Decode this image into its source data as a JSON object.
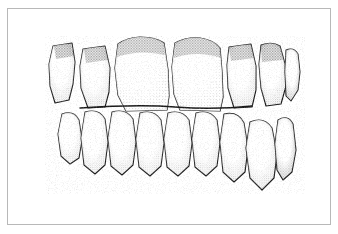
{
  "figure": {
    "medium": "stipple pen-and-ink drawing",
    "subject": "anterior view of upper and lower dental arches in occlusion",
    "background_color": "#ffffff",
    "ink_color": "#1a1a1a",
    "frame": {
      "present": true,
      "style": "thin rectangular rule",
      "color": "#b8b8b8",
      "x": 7,
      "y": 8,
      "width": 324,
      "height": 217
    },
    "labels": [],
    "annotations": [],
    "text_content": []
  },
  "upper_arch": {
    "name": "maxillary-arch",
    "visible_tooth_count": 7,
    "teeth": [
      {
        "id": "upper-left-premolar",
        "position": "far-left",
        "shape": "angled-trapezoid",
        "rotation": "tipped-mesially"
      },
      {
        "id": "upper-left-canine",
        "position": "left",
        "shape": "rounded-cusped"
      },
      {
        "id": "upper-left-lateral-incisor",
        "position": "left-center",
        "shape": "narrow-rectangular"
      },
      {
        "id": "upper-left-central-incisor",
        "position": "center-left",
        "shape": "large-rounded-rectangle",
        "prominent": true
      },
      {
        "id": "upper-right-central-incisor",
        "position": "center-right",
        "shape": "large-rounded-rectangle",
        "prominent": true
      },
      {
        "id": "upper-right-lateral-incisor",
        "position": "right-center",
        "shape": "narrow-rectangular"
      },
      {
        "id": "upper-right-canine",
        "position": "far-right",
        "shape": "angled-rotated",
        "rotation": "rotated-distally"
      }
    ]
  },
  "lower_arch": {
    "name": "mandibular-arch",
    "visible_tooth_count": 8,
    "crowding": "moderate, most evident on the right side where two teeth overlap",
    "teeth": [
      {
        "id": "lower-left-premolar",
        "position": "far-left",
        "shape": "oval-tilted"
      },
      {
        "id": "lower-left-canine",
        "position": "left",
        "shape": "rounded-oval"
      },
      {
        "id": "lower-left-lateral-incisor",
        "position": "left-center",
        "shape": "narrow-oval"
      },
      {
        "id": "lower-left-central-incisor",
        "position": "center-left",
        "shape": "narrow-oval"
      },
      {
        "id": "lower-right-central-incisor",
        "position": "center-right",
        "shape": "narrow-oval"
      },
      {
        "id": "lower-right-lateral-incisor",
        "position": "right-center",
        "shape": "narrow-oval"
      },
      {
        "id": "lower-right-canine",
        "position": "right",
        "shape": "oval-overlapped"
      },
      {
        "id": "lower-right-premolar",
        "position": "far-right",
        "shape": "narrow-rotated",
        "rotation": "labially-displaced"
      }
    ]
  },
  "occlusion": {
    "contact_line_y": 108,
    "description": "upper incisal edges overlap the lower incisors along a dark contact band"
  }
}
